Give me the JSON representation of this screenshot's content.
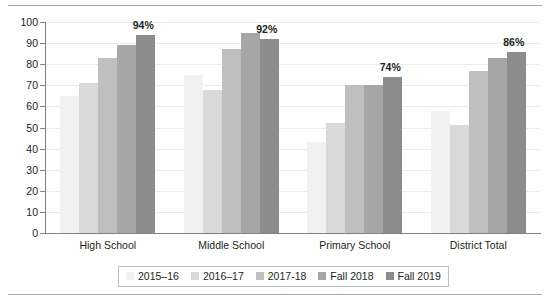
{
  "chart_data": {
    "type": "bar",
    "title": "",
    "xlabel": "",
    "ylabel": "",
    "ylim": [
      0,
      100
    ],
    "ytick_step": 10,
    "yticks": [
      100,
      90,
      80,
      70,
      60,
      50,
      40,
      30,
      20,
      10,
      0
    ],
    "grid": true,
    "legend_position": "bottom",
    "categories": [
      "High School",
      "Middle School",
      "Primary School",
      "District Total"
    ],
    "series": [
      {
        "name": "2015–16",
        "color": "#f1f1f1",
        "values": [
          65,
          75,
          43,
          58
        ]
      },
      {
        "name": "2016–17",
        "color": "#d9d9d9",
        "values": [
          71,
          68,
          52,
          51
        ]
      },
      {
        "name": "2017-18",
        "color": "#bfbfbf",
        "values": [
          83,
          87,
          70,
          77
        ]
      },
      {
        "name": "Fall 2018",
        "color": "#a6a6a6",
        "values": [
          89,
          95,
          70,
          83
        ]
      },
      {
        "name": "Fall 2019",
        "color": "#8c8c8c",
        "values": [
          94,
          92,
          74,
          86
        ]
      }
    ],
    "annotations": [
      {
        "category": "High School",
        "series": "Fall 2019",
        "text": "94%"
      },
      {
        "category": "Middle School",
        "series": "Fall 2019",
        "text": "92%"
      },
      {
        "category": "Primary School",
        "series": "Fall 2019",
        "text": "74%"
      },
      {
        "category": "District Total",
        "series": "Fall 2019",
        "text": "86%"
      }
    ]
  },
  "colors": {
    "axis": "#808285",
    "grid": "#e8eaec",
    "rule": "#a7a9ac",
    "text": "#231f20",
    "legend_border": "#bcbec0"
  }
}
